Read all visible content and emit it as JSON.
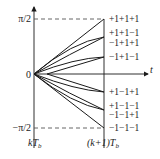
{
  "diagram": {
    "y_axis": {
      "top_label": "π/2",
      "zero_label": "0",
      "bottom_label": "−π/2"
    },
    "x_axis": {
      "label": "t",
      "start_label": "kT",
      "start_sub": "b",
      "end_label": "(k+1)T",
      "end_sub": "b"
    },
    "phase_labels": [
      "+1+1+1",
      "+1+1−1",
      "−1+1+1",
      "−1+1−1",
      "+1−1+1",
      "+1−1−1",
      "−1−1+1",
      "−1−1−1"
    ],
    "colors": {
      "line": "#1a1a1a",
      "dashed": "#555555",
      "text": "#222222"
    }
  }
}
